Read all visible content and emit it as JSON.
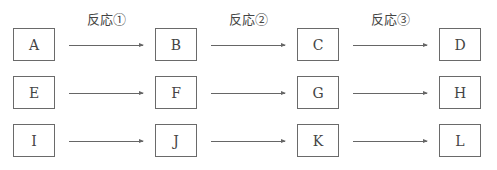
{
  "reactions": [
    {
      "label": "反応①"
    },
    {
      "label": "反応②"
    },
    {
      "label": "反応③"
    }
  ],
  "rows": [
    {
      "boxes": [
        "A",
        "B",
        "C",
        "D"
      ]
    },
    {
      "boxes": [
        "E",
        "F",
        "G",
        "H"
      ]
    },
    {
      "boxes": [
        "I",
        "J",
        "K",
        "L"
      ]
    }
  ]
}
